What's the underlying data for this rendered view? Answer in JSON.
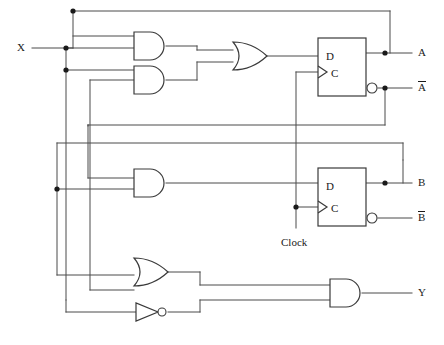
{
  "diagram": {
    "type": "digital-logic-schematic",
    "inputs": [
      {
        "id": "x",
        "label": "X",
        "x": 20,
        "y": 48
      },
      {
        "id": "clock",
        "label": "Clock",
        "x": 283,
        "y": 243
      }
    ],
    "outputs": [
      {
        "id": "a",
        "label": "A",
        "overbar": false,
        "x": 420,
        "y": 53
      },
      {
        "id": "a_not",
        "label": "A",
        "overbar": true,
        "x": 420,
        "y": 88
      },
      {
        "id": "b",
        "label": "B",
        "overbar": false,
        "x": 420,
        "y": 183
      },
      {
        "id": "b_not",
        "label": "B",
        "overbar": true,
        "x": 420,
        "y": 218
      },
      {
        "id": "y",
        "label": "Y",
        "overbar": false,
        "x": 420,
        "y": 293
      }
    ],
    "gates": [
      {
        "id": "and1",
        "type": "AND",
        "inputs": 2,
        "x": 134,
        "y": 32,
        "w": 32,
        "h": 28
      },
      {
        "id": "and2",
        "type": "AND",
        "inputs": 2,
        "x": 134,
        "y": 66,
        "w": 32,
        "h": 28
      },
      {
        "id": "or1",
        "type": "OR",
        "inputs": 2,
        "x": 233,
        "y": 42,
        "w": 34,
        "h": 28
      },
      {
        "id": "and3",
        "type": "AND",
        "inputs": 2,
        "x": 134,
        "y": 168,
        "w": 32,
        "h": 28
      },
      {
        "id": "or2",
        "type": "OR",
        "inputs": 2,
        "x": 134,
        "y": 258,
        "w": 34,
        "h": 28
      },
      {
        "id": "not1",
        "type": "NOT",
        "inputs": 1,
        "x": 136,
        "y": 304,
        "w": 26,
        "h": 20
      },
      {
        "id": "and4",
        "type": "AND",
        "inputs": 2,
        "x": 330,
        "y": 279,
        "w": 32,
        "h": 28
      }
    ],
    "flipflops": [
      {
        "id": "ff-a",
        "type": "D-flip-flop",
        "d_label": "D",
        "c_label": "C",
        "x": 318,
        "y": 38,
        "w": 48,
        "h": 58,
        "q_output": "A",
        "qbar_output": "A-not"
      },
      {
        "id": "ff-b",
        "type": "D-flip-flop",
        "d_label": "D",
        "c_label": "C",
        "x": 318,
        "y": 168,
        "w": 48,
        "h": 58,
        "q_output": "B",
        "qbar_output": "B-not"
      }
    ],
    "junction_dots": [
      {
        "x": 66,
        "y": 48
      },
      {
        "x": 66,
        "y": 70
      },
      {
        "x": 73,
        "y": 11
      },
      {
        "x": 57,
        "y": 189
      },
      {
        "x": 296,
        "y": 207
      },
      {
        "x": 385,
        "y": 53
      },
      {
        "x": 385,
        "y": 88
      },
      {
        "x": 385,
        "y": 183
      }
    ],
    "colors": {
      "wire": "#4a4a4a",
      "gate_stroke": "#3a3a3a",
      "text": "#1a1a1a",
      "background": "#ffffff"
    }
  }
}
